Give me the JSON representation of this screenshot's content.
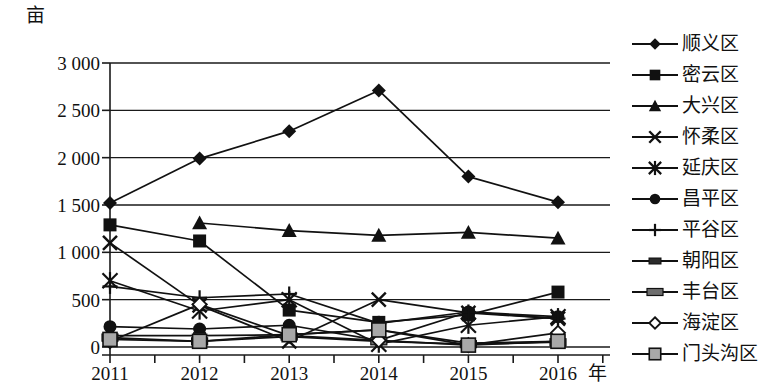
{
  "chart_data": {
    "type": "line",
    "title": "",
    "xlabel": "年",
    "ylabel": "亩",
    "categories": [
      "2011",
      "2012",
      "2013",
      "2014",
      "2015",
      "2016"
    ],
    "ytick_labels": [
      "3 000",
      "2 500",
      "2 000",
      "1 500",
      "1 000",
      "500",
      "0"
    ],
    "ytick_values": [
      3000,
      2500,
      2000,
      1500,
      1000,
      500,
      0
    ],
    "ylim": [
      0,
      3000
    ],
    "grid": true,
    "legend_position": "right",
    "series": [
      {
        "name": "顺义区",
        "marker": "diamond",
        "values": [
          1520,
          1990,
          2280,
          2710,
          1800,
          1530
        ]
      },
      {
        "name": "密云区",
        "marker": "square",
        "values": [
          1290,
          1120,
          390,
          260,
          340,
          580
        ]
      },
      {
        "name": "大兴区",
        "marker": "triangle",
        "values": [
          null,
          1310,
          1230,
          1180,
          1210,
          1150
        ]
      },
      {
        "name": "怀柔区",
        "marker": "cross-x",
        "values": [
          1100,
          440,
          60,
          500,
          360,
          300
        ]
      },
      {
        "name": "延庆区",
        "marker": "asterisk",
        "values": [
          700,
          380,
          500,
          30,
          230,
          320
        ]
      },
      {
        "name": "昌平区",
        "marker": "circle",
        "values": [
          215,
          190,
          230,
          70,
          370,
          320
        ]
      },
      {
        "name": "平谷区",
        "marker": "plus",
        "values": [
          640,
          520,
          560,
          250,
          370,
          300
        ]
      },
      {
        "name": "朝阳区",
        "marker": "dark-bar",
        "values": [
          120,
          120,
          130,
          180,
          40,
          60
        ]
      },
      {
        "name": "丰台区",
        "marker": "bar",
        "values": [
          100,
          60,
          110,
          60,
          30,
          50
        ]
      },
      {
        "name": "海淀区",
        "marker": "open-diamond",
        "values": [
          60,
          450,
          120,
          70,
          20,
          150
        ]
      },
      {
        "name": "门头沟区",
        "marker": "gray-square",
        "values": [
          80,
          60,
          130,
          180,
          20,
          60
        ]
      }
    ]
  }
}
